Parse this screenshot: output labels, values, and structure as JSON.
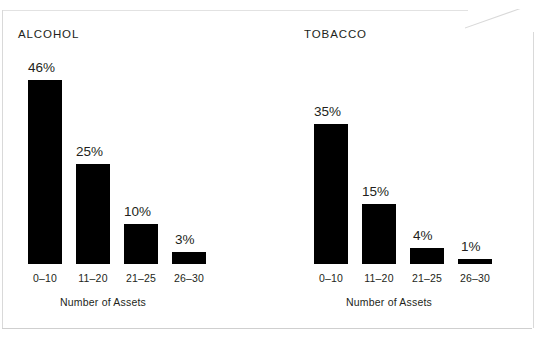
{
  "page": {
    "background_color": "#ffffff",
    "border_color": "#d9d9d9",
    "bar_color": "#000000",
    "text_color": "#231f20"
  },
  "chart_data": [
    {
      "type": "bar",
      "title": "ALCOHOL",
      "categories": [
        "0–10",
        "11–20",
        "21–25",
        "26–30"
      ],
      "values": [
        46,
        25,
        10,
        3
      ],
      "value_labels": [
        "46%",
        "25%",
        "10%",
        "3%"
      ],
      "xlabel": "Number of Assets",
      "ylabel": "",
      "ylim": [
        0,
        50
      ],
      "grid": false,
      "legend": "none",
      "unit": "percent"
    },
    {
      "type": "bar",
      "title": "TOBACCO",
      "categories": [
        "0–10",
        "11–20",
        "21–25",
        "26–30"
      ],
      "values": [
        35,
        15,
        4,
        1
      ],
      "value_labels": [
        "35%",
        "15%",
        "4%",
        "1%"
      ],
      "xlabel": "Number of Assets",
      "ylabel": "",
      "ylim": [
        0,
        50
      ],
      "grid": false,
      "legend": "none",
      "unit": "percent"
    }
  ]
}
